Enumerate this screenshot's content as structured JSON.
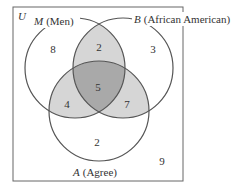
{
  "diagram": {
    "type": "venn-3-set",
    "universe_label": "U",
    "sets": [
      {
        "id": "M",
        "letter": "M",
        "name": "(Men)"
      },
      {
        "id": "B",
        "letter": "B",
        "name": "(African American)"
      },
      {
        "id": "A",
        "letter": "A",
        "name": "(Agree)"
      }
    ],
    "regions": {
      "M_only": "8",
      "B_only": "3",
      "A_only": "2",
      "M_and_B_only": "2",
      "M_and_A_only": "4",
      "B_and_A_only": "7",
      "M_B_A": "5",
      "outside": "9"
    },
    "colors": {
      "outline": "#555555",
      "two_overlap": "#d4d4d4",
      "three_overlap": "#a8a8a8",
      "background": "#ffffff"
    }
  }
}
